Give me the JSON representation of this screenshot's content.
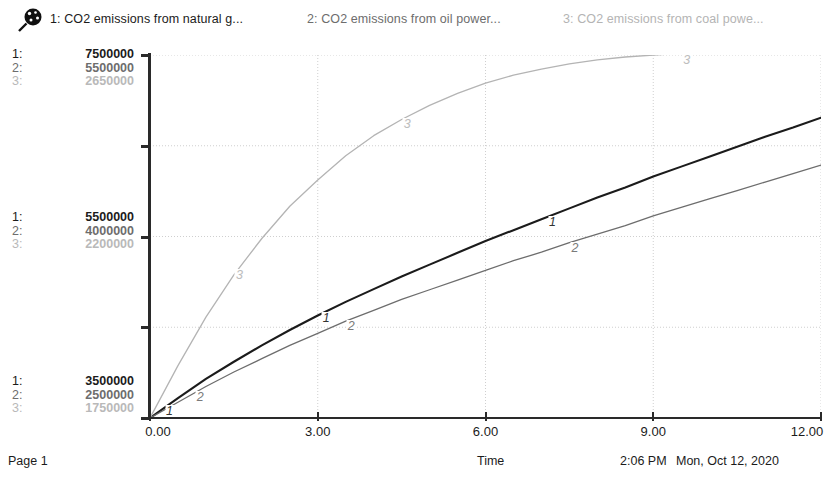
{
  "legend": {
    "icon": "magnifier-icon",
    "entries": [
      {
        "index": "1:",
        "label": "1: CO2 emissions from natural g...",
        "color": "#1b1b1b"
      },
      {
        "index": "2:",
        "label": "2: CO2 emissions from oil power...",
        "color": "#6d6d6d"
      },
      {
        "index": "3:",
        "label": "3: CO2 emissions from coal powe...",
        "color": "#b4b4b4"
      }
    ]
  },
  "y_scales": {
    "top": {
      "idx": [
        "1:",
        "2:",
        "3:"
      ],
      "values": [
        "7500000",
        "5500000",
        "2650000"
      ]
    },
    "middle": {
      "idx": [
        "1:",
        "2:",
        "3:"
      ],
      "values": [
        "5500000",
        "4000000",
        "2200000"
      ]
    },
    "bottom": {
      "idx": [
        "1:",
        "2:",
        "3:"
      ],
      "values": [
        "3500000",
        "2500000",
        "1750000"
      ]
    }
  },
  "x_axis": {
    "title": "Time",
    "ticks": [
      "0.00",
      "3.00",
      "6.00",
      "9.00",
      "12.00"
    ]
  },
  "curve_tags": [
    {
      "series": "1",
      "label": "1"
    },
    {
      "series": "1",
      "label": "1"
    },
    {
      "series": "1",
      "label": "1"
    },
    {
      "series": "2",
      "label": "2"
    },
    {
      "series": "2",
      "label": "2"
    },
    {
      "series": "2",
      "label": "2"
    },
    {
      "series": "3",
      "label": "3"
    },
    {
      "series": "3",
      "label": "3"
    },
    {
      "series": "3",
      "label": "3"
    }
  ],
  "footer": {
    "page": "Page 1",
    "time": "2:06 PM",
    "date": "Mon, Oct 12, 2020"
  },
  "chart_data": {
    "type": "line",
    "title": "",
    "xlabel": "Time",
    "ylabel": "",
    "xlim": [
      0,
      12
    ],
    "grid": true,
    "legend_position": "top",
    "x": [
      0,
      0.5,
      1,
      1.5,
      2,
      2.5,
      3,
      3.5,
      4,
      4.5,
      5,
      5.5,
      6,
      6.5,
      7,
      7.5,
      8,
      8.5,
      9,
      9.5,
      10,
      10.5,
      11,
      11.5,
      12
    ],
    "series": [
      {
        "name": "1: CO2 emissions from natural gas power plants",
        "color": "#1b1b1b",
        "axis_min": 3500000,
        "axis_mid": 5500000,
        "axis_max": 7500000,
        "values": [
          3500000,
          3720000,
          3930000,
          4120000,
          4300000,
          4470000,
          4630000,
          4780000,
          4920000,
          5060000,
          5190000,
          5320000,
          5450000,
          5570000,
          5690000,
          5810000,
          5930000,
          6040000,
          6160000,
          6270000,
          6380000,
          6490000,
          6600000,
          6700000,
          6810000
        ]
      },
      {
        "name": "2: CO2 emissions from oil power plants",
        "color": "#6d6d6d",
        "axis_min": 2500000,
        "axis_mid": 4000000,
        "axis_max": 5500000,
        "values": [
          2500000,
          2630000,
          2760000,
          2880000,
          2990000,
          3100000,
          3200000,
          3300000,
          3390000,
          3480000,
          3560000,
          3640000,
          3720000,
          3800000,
          3870000,
          3950000,
          4020000,
          4090000,
          4170000,
          4240000,
          4310000,
          4380000,
          4450000,
          4520000,
          4590000
        ]
      },
      {
        "name": "3: CO2 emissions from coal power plants",
        "color": "#b4b4b4",
        "axis_min": 1750000,
        "axis_mid": 2200000,
        "axis_max": 2650000,
        "values": [
          1750000,
          1880000,
          2000000,
          2105000,
          2195000,
          2275000,
          2340000,
          2400000,
          2450000,
          2490000,
          2525000,
          2555000,
          2580000,
          2600000,
          2615000,
          2628000,
          2638000,
          2645000,
          2650000,
          2654000,
          2657000,
          2659000,
          2661000,
          2662000,
          2663000
        ]
      }
    ]
  }
}
